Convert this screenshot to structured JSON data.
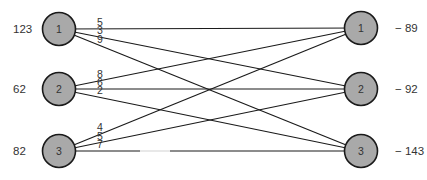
{
  "diagram": {
    "type": "bipartite-transportation-network",
    "colors": {
      "node_fill": "#a9a9a9",
      "node_stroke": "#1a1a1a",
      "edge": "#1a1a1a",
      "text": "#333333",
      "background": "#ffffff"
    },
    "sources": [
      {
        "id": "1",
        "label": "1",
        "supply": "123",
        "cx": 59,
        "cy": 29
      },
      {
        "id": "2",
        "label": "2",
        "supply": "62",
        "cx": 59,
        "cy": 89
      },
      {
        "id": "3",
        "label": "3",
        "supply": "82",
        "cx": 59,
        "cy": 151
      }
    ],
    "sinks": [
      {
        "id": "1",
        "label": "1",
        "demand": "− 89",
        "cx": 361,
        "cy": 28
      },
      {
        "id": "2",
        "label": "2",
        "demand": "− 92",
        "cx": 361,
        "cy": 89
      },
      {
        "id": "3",
        "label": "3",
        "demand": "− 143",
        "cx": 361,
        "cy": 151
      }
    ],
    "edges": [
      {
        "from": "1",
        "to": "1",
        "cost": "5"
      },
      {
        "from": "1",
        "to": "2",
        "cost": "3"
      },
      {
        "from": "1",
        "to": "3",
        "cost": "9"
      },
      {
        "from": "2",
        "to": "1",
        "cost": "8"
      },
      {
        "from": "2",
        "to": "2",
        "cost": "6"
      },
      {
        "from": "2",
        "to": "3",
        "cost": "2"
      },
      {
        "from": "3",
        "to": "1",
        "cost": "4"
      },
      {
        "from": "3",
        "to": "2",
        "cost": "5"
      },
      {
        "from": "3",
        "to": "3",
        "cost": "7"
      }
    ]
  }
}
